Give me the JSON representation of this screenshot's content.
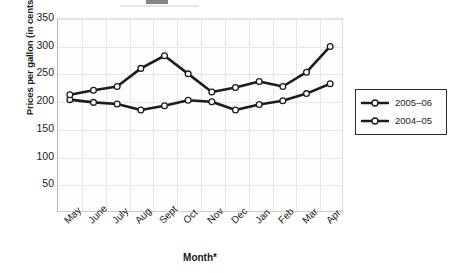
{
  "chart_data": {
    "type": "line",
    "title": "",
    "xlabel": "Month*",
    "ylabel": "Prices per gallon (in cents)",
    "categories": [
      "May",
      "June",
      "July",
      "Aug",
      "Sept",
      "Oct",
      "Nov",
      "Dec",
      "Jan",
      "Feb",
      "Mar",
      "Apr"
    ],
    "yticks": [
      50,
      100,
      150,
      200,
      250,
      300,
      350
    ],
    "ylim": [
      0,
      350
    ],
    "grid": true,
    "legend_position": "right",
    "series": [
      {
        "name": "2005-06",
        "label": "2005–06",
        "color": "#1c1c1c",
        "marker": "open-circle",
        "values": [
          203,
          198,
          195,
          184,
          192,
          202,
          199,
          184,
          194,
          201,
          214,
          232
        ]
      },
      {
        "name": "2004-05",
        "label": "2004–05",
        "color": "#1c1c1c",
        "marker": "open-circle",
        "values": [
          212,
          220,
          227,
          260,
          283,
          250,
          217,
          225,
          236,
          227,
          253,
          300
        ]
      }
    ]
  },
  "legend": {
    "entries": [
      {
        "label": "2005–06"
      },
      {
        "label": "2004–05"
      }
    ]
  },
  "axes": {
    "y_title": "Prices per gallon (in cents)",
    "x_title": "Month*"
  }
}
